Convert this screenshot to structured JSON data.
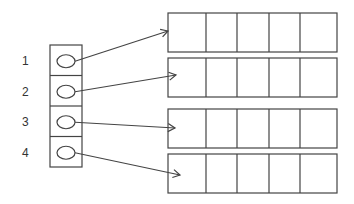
{
  "diagram": {
    "type": "array-of-pointers",
    "index_labels": [
      "1",
      "2",
      "3",
      "4"
    ],
    "pointer_array": {
      "slots": 4,
      "slot_content": "pointer-oval"
    },
    "target_arrays": [
      {
        "index": "1",
        "cells": 5
      },
      {
        "index": "2",
        "cells": 5
      },
      {
        "index": "3",
        "cells": 5
      },
      {
        "index": "4",
        "cells": 5
      }
    ],
    "colors": {
      "stroke": "#444444",
      "text": "#333333",
      "background": "#ffffff"
    }
  }
}
